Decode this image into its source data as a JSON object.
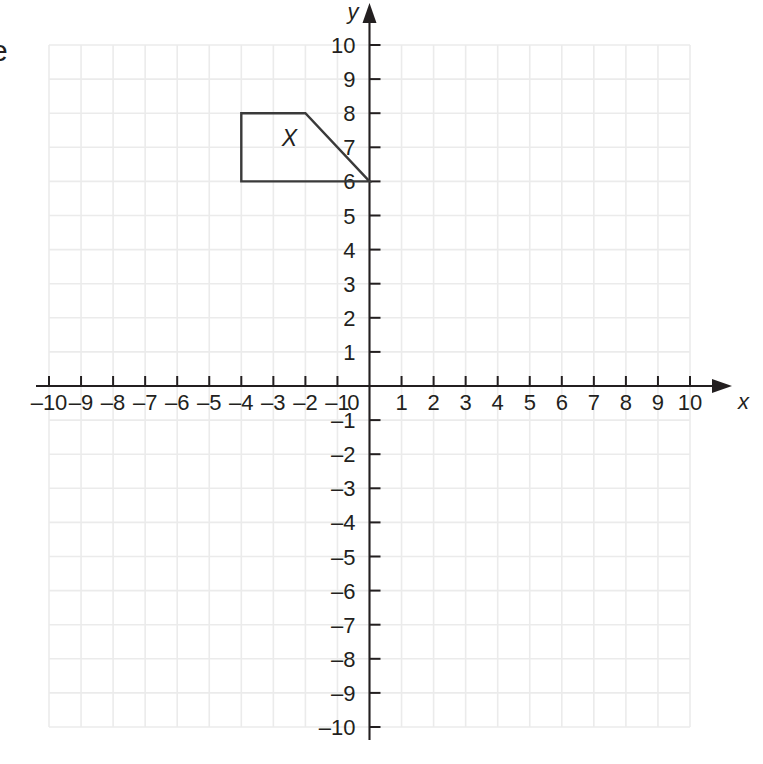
{
  "figure": {
    "type": "coordinate-plane",
    "background_color": "#ffffff",
    "grid_color": "#ebebeb",
    "axis_color": "#231f20",
    "shape_color": "#3a3a3a"
  },
  "axes": {
    "x_axis_name": "x",
    "y_axis_name": "y",
    "x_min": -10,
    "x_max": 10,
    "y_min": -10,
    "y_max": 10,
    "x_tick_labels": [
      "–10",
      "–9",
      "–8",
      "–7",
      "–6",
      "–5",
      "–4",
      "–3",
      "–2",
      "–1",
      "1",
      "2",
      "3",
      "4",
      "5",
      "6",
      "7",
      "8",
      "9",
      "10"
    ],
    "y_tick_labels": [
      "10",
      "9",
      "8",
      "7",
      "6",
      "5",
      "4",
      "3",
      "2",
      "1",
      "–1",
      "–2",
      "–3",
      "–4",
      "–5",
      "–6",
      "–7",
      "–8",
      "–9",
      "–10"
    ],
    "origin_label": "0"
  },
  "shape": {
    "label": "X",
    "label_position": {
      "x": -2.5,
      "y": 7.05
    },
    "vertices": [
      {
        "x": -4,
        "y": 8
      },
      {
        "x": -2,
        "y": 8
      },
      {
        "x": 0,
        "y": 6
      },
      {
        "x": -4,
        "y": 6
      }
    ],
    "closed": true
  },
  "edge_fragment": {
    "text": "e"
  },
  "chart_data": {
    "type": "scatter",
    "title": "",
    "xlabel": "x",
    "ylabel": "y",
    "xlim": [
      -10,
      10
    ],
    "ylim": [
      -10,
      10
    ],
    "grid": true,
    "legend": "none",
    "x_ticks": [
      -10,
      -9,
      -8,
      -7,
      -6,
      -5,
      -4,
      -3,
      -2,
      -1,
      0,
      1,
      2,
      3,
      4,
      5,
      6,
      7,
      8,
      9,
      10
    ],
    "y_ticks": [
      -10,
      -9,
      -8,
      -7,
      -6,
      -5,
      -4,
      -3,
      -2,
      -1,
      0,
      1,
      2,
      3,
      4,
      5,
      6,
      7,
      8,
      9,
      10
    ],
    "annotations": [
      {
        "text": "X",
        "x": -2.5,
        "y": 7.05
      }
    ],
    "series": [
      {
        "name": "Trapezoid X",
        "type": "polygon",
        "closed": true,
        "x": [
          -4,
          -2,
          0,
          -4
        ],
        "y": [
          8,
          8,
          6,
          6
        ]
      }
    ]
  }
}
